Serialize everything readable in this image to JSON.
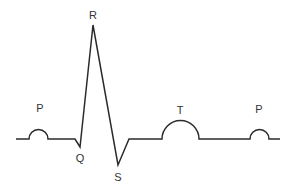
{
  "diagram": {
    "type": "ecg-waveform",
    "stroke_color": "#2b2b2b",
    "label_color": "#333333",
    "labels": {
      "p1": "P",
      "r": "R",
      "q": "Q",
      "s": "S",
      "t": "T",
      "p2": "P"
    }
  }
}
